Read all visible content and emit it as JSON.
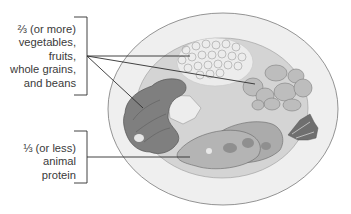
{
  "diagram": {
    "type": "healthy-plate-illustration",
    "labels": {
      "plant_foods": {
        "line1": "⅔ (or more)",
        "line2": "vegetables,",
        "line3": "fruits,",
        "line4": "whole grains,",
        "line5": "and beans",
        "points_to": [
          "grains",
          "fruit-slices",
          "broccoli"
        ]
      },
      "animal_protein": {
        "line1": "⅓ (or less)",
        "line2": "animal",
        "line3": "protein",
        "points_to": [
          "fish-steak"
        ]
      }
    },
    "foods": [
      "grains",
      "fruit-slices",
      "broccoli",
      "fish-steak",
      "lettuce-garnish"
    ],
    "colors": {
      "plate_rim": "#efefef",
      "plate_center": "#d2d2d2",
      "plate_outline": "#7a7a7a",
      "broccoli": "#7f7f7f",
      "fish": "#a9a9a9",
      "fruit": "#bdbdbd",
      "grains": "#ededed",
      "leader_line": "#2e2e2e",
      "text": "#3a3a3a"
    }
  }
}
